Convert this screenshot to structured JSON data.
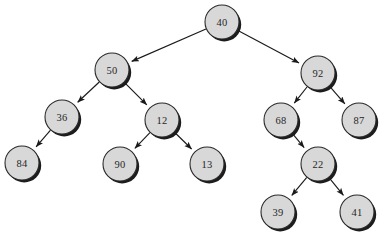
{
  "figure": {
    "background_color": "#ffffff",
    "node_fill_color": "#d8d8d8",
    "node_stroke_color": "#2a2a2a",
    "edge_color": "#1a1a1a",
    "label_color": "#262626",
    "node_radius": 17,
    "width": 387,
    "height": 237
  },
  "chart_data": {
    "type": "diagram",
    "diagram_kind": "binary-tree",
    "title": "",
    "root": "40",
    "nodes": [
      {
        "id": "n40",
        "label": "40",
        "x": 222,
        "y": 22,
        "level": 0
      },
      {
        "id": "n50",
        "label": "50",
        "x": 112,
        "y": 70,
        "level": 1
      },
      {
        "id": "n92",
        "label": "92",
        "x": 318,
        "y": 73,
        "level": 1
      },
      {
        "id": "n36",
        "label": "36",
        "x": 62,
        "y": 117,
        "level": 2
      },
      {
        "id": "n12",
        "label": "12",
        "x": 162,
        "y": 120,
        "level": 2
      },
      {
        "id": "n68",
        "label": "68",
        "x": 281,
        "y": 120,
        "level": 2
      },
      {
        "id": "n87",
        "label": "87",
        "x": 359,
        "y": 120,
        "level": 2
      },
      {
        "id": "n84",
        "label": "84",
        "x": 22,
        "y": 163,
        "level": 3
      },
      {
        "id": "n90",
        "label": "90",
        "x": 120,
        "y": 164,
        "level": 3
      },
      {
        "id": "n13",
        "label": "13",
        "x": 207,
        "y": 164,
        "level": 3
      },
      {
        "id": "n22",
        "label": "22",
        "x": 318,
        "y": 164,
        "level": 3
      },
      {
        "id": "n39",
        "label": "39",
        "x": 278,
        "y": 212,
        "level": 4
      },
      {
        "id": "n41",
        "label": "41",
        "x": 357,
        "y": 212,
        "level": 4
      }
    ],
    "edges": [
      {
        "from": "n40",
        "to": "n50",
        "side": "left",
        "arrow": true
      },
      {
        "from": "n40",
        "to": "n92",
        "side": "right",
        "arrow": true
      },
      {
        "from": "n50",
        "to": "n36",
        "side": "left",
        "arrow": true
      },
      {
        "from": "n50",
        "to": "n12",
        "side": "right",
        "arrow": true
      },
      {
        "from": "n36",
        "to": "n84",
        "side": "left",
        "arrow": true
      },
      {
        "from": "n12",
        "to": "n90",
        "side": "left",
        "arrow": true
      },
      {
        "from": "n12",
        "to": "n13",
        "side": "right",
        "arrow": true
      },
      {
        "from": "n92",
        "to": "n68",
        "side": "left",
        "arrow": true
      },
      {
        "from": "n92",
        "to": "n87",
        "side": "right",
        "arrow": true
      },
      {
        "from": "n68",
        "to": "n22",
        "side": "right",
        "arrow": true
      },
      {
        "from": "n22",
        "to": "n39",
        "side": "left",
        "arrow": true
      },
      {
        "from": "n22",
        "to": "n41",
        "side": "right",
        "arrow": true
      }
    ]
  }
}
